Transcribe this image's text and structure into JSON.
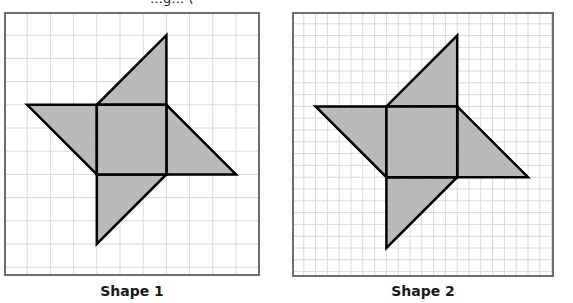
{
  "header_fragment": "…g… (",
  "shapes": [
    {
      "caption": "Shape 1",
      "grid": {
        "columns": 11,
        "rows": 11,
        "cell_px": 23.2
      },
      "fill": "#b3b3b3",
      "outline": "#000000",
      "gridline_color": "#d9d9d9",
      "border_color": "#6e6e6e",
      "vertices_grid": {
        "top_tip": [
          7,
          1
        ],
        "left_tip": [
          1,
          4
        ],
        "square_tl": [
          4,
          4
        ],
        "square_tr": [
          7,
          4
        ],
        "square_bl": [
          4,
          7
        ],
        "square_br": [
          7,
          7
        ],
        "right_tip": [
          10,
          7
        ],
        "bottom_tip": [
          4,
          10
        ]
      }
    },
    {
      "caption": "Shape 2",
      "grid": {
        "columns": 22,
        "rows": 22,
        "cell_px": 11.8
      },
      "fill": "#b3b3b3",
      "outline": "#000000",
      "gridline_color": "#d9d9d9",
      "border_color": "#6e6e6e",
      "vertices_grid": {
        "top_tip": [
          14,
          2
        ],
        "left_tip": [
          2,
          8
        ],
        "square_tl": [
          8,
          8
        ],
        "square_tr": [
          14,
          8
        ],
        "square_bl": [
          8,
          14
        ],
        "square_br": [
          14,
          14
        ],
        "right_tip": [
          20,
          14
        ],
        "bottom_tip": [
          8,
          20
        ]
      }
    }
  ]
}
